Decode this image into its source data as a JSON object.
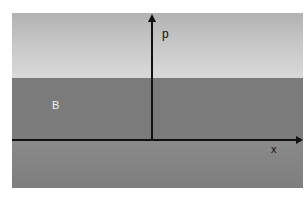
{
  "diagram": {
    "regions": [
      {
        "name": "upper-region",
        "color_top": "#b2b2b2",
        "color_bottom": "#d9d9d9"
      },
      {
        "name": "region-b",
        "label": "B",
        "color": "#7b7b7b"
      },
      {
        "name": "lower-region",
        "color_top": "#8a8a8a",
        "color_bottom": "#7e7e7e"
      }
    ],
    "axes": {
      "vertical_label": "p",
      "horizontal_label": "x",
      "color": "#111111"
    }
  }
}
